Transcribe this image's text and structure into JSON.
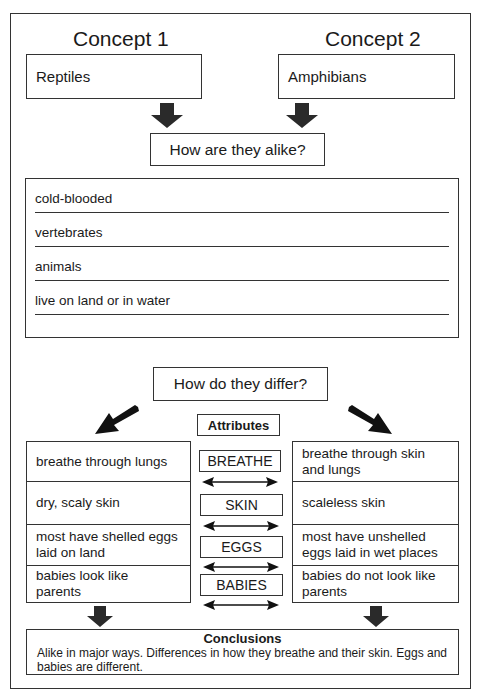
{
  "concepts": [
    {
      "heading": "Concept 1",
      "value": "Reptiles"
    },
    {
      "heading": "Concept 2",
      "value": "Amphibians"
    }
  ],
  "alike": {
    "question": "How are they alike?",
    "items": [
      "cold-blooded",
      "vertebrates",
      "animals",
      "live on land or in water",
      ""
    ]
  },
  "differ": {
    "question": "How do they differ?",
    "attributes_heading": "Attributes",
    "rows": [
      {
        "attribute": "BREATHE",
        "concept1": "breathe through lungs",
        "concept2": "breathe through skin and lungs"
      },
      {
        "attribute": "SKIN",
        "concept1": "dry, scaly skin",
        "concept2": "scaleless skin"
      },
      {
        "attribute": "EGGS",
        "concept1": "most have shelled eggs laid on land",
        "concept2": "most have unshelled eggs laid in wet places"
      },
      {
        "attribute": "BABIES",
        "concept1": "babies look like parents",
        "concept2": "babies do not look like parents"
      }
    ]
  },
  "conclusions": {
    "title": "Conclusions",
    "text": "Alike in major ways. Differences in how they breathe and their skin. Eggs and babies are different."
  },
  "colors": {
    "ink": "#1a1a1a",
    "arrow": "#2a2a2a",
    "paper": "#ffffff"
  }
}
